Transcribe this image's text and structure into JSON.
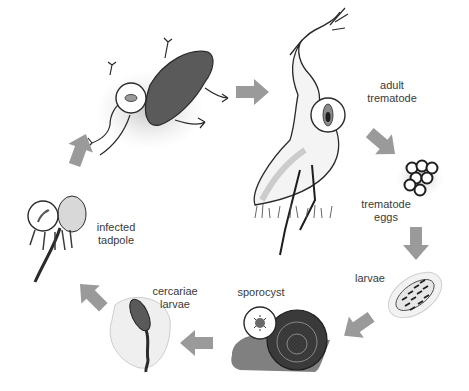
{
  "colors": {
    "arrow": "#9a9a9a",
    "ink": "#2a2a2a",
    "wash": "#c8c8c8",
    "text": "#3a3a3a"
  },
  "stages": [
    {
      "id": "adult-trematode",
      "lines": [
        "adult",
        "trematode"
      ],
      "host": "heron"
    },
    {
      "id": "trematode-eggs",
      "lines": [
        "trematode",
        "eggs"
      ],
      "host": "egg-cluster"
    },
    {
      "id": "larvae",
      "lines": [
        "larvae"
      ],
      "host": "larva"
    },
    {
      "id": "sporocyst",
      "lines": [
        "sporocyst"
      ],
      "host": "snail"
    },
    {
      "id": "cercariae-larvae",
      "lines": [
        "cercariae",
        "larvae"
      ],
      "host": "cercaria"
    },
    {
      "id": "infected-tadpole",
      "lines": [
        "infected",
        "tadpole"
      ],
      "host": "tadpole"
    },
    {
      "id": "infected-frog",
      "lines": [],
      "host": "frog"
    }
  ],
  "arrows": [
    {
      "from": "frog",
      "to": "heron",
      "direction": "right"
    },
    {
      "from": "heron",
      "to": "eggs",
      "direction": "down-right"
    },
    {
      "from": "eggs",
      "to": "larvae",
      "direction": "down"
    },
    {
      "from": "larvae",
      "to": "snail",
      "direction": "down-left"
    },
    {
      "from": "snail",
      "to": "cercariae",
      "direction": "left"
    },
    {
      "from": "cercariae",
      "to": "tadpole",
      "direction": "up-left"
    },
    {
      "from": "tadpole",
      "to": "frog",
      "direction": "up"
    }
  ]
}
